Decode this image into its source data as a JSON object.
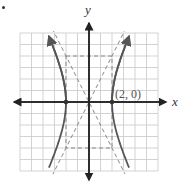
{
  "figure": {
    "x_label": "x",
    "y_label": "y",
    "point_label": "(2, 0)",
    "colors": {
      "grid": "#c8c8c8",
      "axes": "#222222",
      "curve": "#555555",
      "dashed": "#888888"
    }
  },
  "chart_data": {
    "type": "line",
    "title": "",
    "equation": "x^2/4 - y^2/16 = 1",
    "xlabel": "x",
    "ylabel": "y",
    "xlim": [
      -6,
      6
    ],
    "ylim": [
      -6,
      6
    ],
    "grid": true,
    "series": [
      {
        "name": "hyperbola-right-branch",
        "style": "solid",
        "vertex": [
          2,
          0
        ]
      },
      {
        "name": "hyperbola-left-branch",
        "style": "solid",
        "vertex": [
          -2,
          0
        ]
      },
      {
        "name": "asymptote-1",
        "style": "dashed",
        "equation": "y = 2x"
      },
      {
        "name": "asymptote-2",
        "style": "dashed",
        "equation": "y = -2x"
      },
      {
        "name": "fundamental-rectangle",
        "style": "dashed",
        "corners": [
          [
            -2,
            4
          ],
          [
            2,
            4
          ],
          [
            2,
            -4
          ],
          [
            -2,
            -4
          ]
        ]
      }
    ],
    "points": [
      {
        "x": 2,
        "y": 0,
        "label": "(2, 0)"
      },
      {
        "x": -2,
        "y": 0,
        "label": ""
      }
    ],
    "annotations": [
      "(2, 0)"
    ]
  }
}
